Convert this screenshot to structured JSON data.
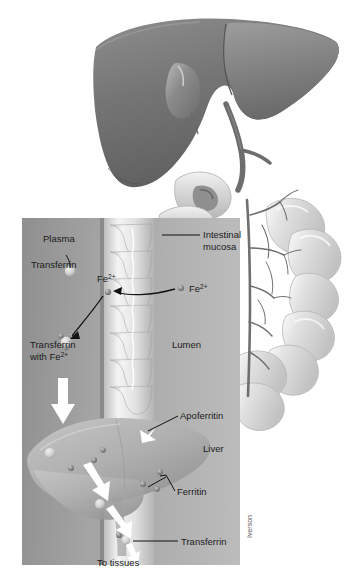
{
  "figure": {
    "signature": "Iverson",
    "palette": {
      "background": "#ffffff",
      "liver_top_dark": "#6e6e6e",
      "liver_top_light": "#9a9a9a",
      "panel_bg": "#a8a8a8",
      "panel_plasma": "#9b9b9b",
      "panel_lumen": "#b4b4b4",
      "villi": "#e6e6e6",
      "intestine": "#d8d8d8",
      "vessel": "#6b6b6b",
      "iron_particle": "#8a8a8a",
      "arrow_white": "#ffffff",
      "arrow_black": "#111111",
      "label_text": "#1b1b1b"
    }
  },
  "labels": {
    "plasma": "Plasma",
    "transferrin": "Transferrin",
    "transferrin_with_fe_line1": "Transferrin",
    "transferrin_with_fe_line2": "with Fe",
    "fe_superscript": "2+",
    "fe_ion_left": "Fe",
    "fe_ion_right": "Fe",
    "intestinal_mucosa_line1": "Intestinal",
    "intestinal_mucosa_line2": "mucosa",
    "lumen": "Lumen",
    "apoferritin": "Apoferritin",
    "liver": "Liver",
    "ferritin": "Ferritin",
    "transferrin_liver": "Transferrin",
    "to_tissues": "To tissues"
  },
  "diagram_parts": {
    "organs": [
      {
        "name": "liver",
        "region": "top"
      },
      {
        "name": "gallbladder",
        "region": "top"
      },
      {
        "name": "bile-duct",
        "region": "top"
      },
      {
        "name": "duodenum",
        "region": "top"
      },
      {
        "name": "small-intestine",
        "region": "right"
      },
      {
        "name": "mesenteric-vessels",
        "region": "right"
      }
    ],
    "inset_panel": {
      "x": 22,
      "y": 218,
      "width": 218,
      "height": 347,
      "regions": [
        "plasma",
        "intestinal-mucosa-villi",
        "lumen",
        "liver-schematic"
      ]
    },
    "iron_particle_count_villi": 2,
    "iron_particle_count_liver": 9,
    "flow_steps": [
      "Fe2+ in lumen",
      "Fe2+ crosses intestinal mucosa",
      "Binds transferrin in plasma",
      "Transferrin with Fe2+ travels to liver",
      "Stored as ferritin via apoferritin",
      "Released on transferrin to tissues"
    ]
  }
}
